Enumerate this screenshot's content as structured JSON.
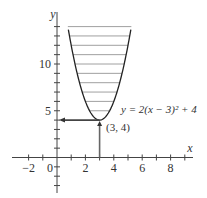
{
  "chart_data": {
    "type": "line",
    "title": "",
    "equation_label": "y = 2(x − 3)² + 4",
    "point_label": "(3, 4)",
    "xlabel": "x",
    "ylabel": "y",
    "xlim": [
      -3,
      9.5
    ],
    "ylim": [
      -2,
      15
    ],
    "x_ticks": [
      -2,
      0,
      2,
      4,
      6,
      8
    ],
    "x_tick_labels": [
      "−2",
      "0",
      "2",
      "4",
      "6",
      "8"
    ],
    "y_ticks": [
      5,
      10
    ],
    "y_tick_labels": [
      "5",
      "10"
    ],
    "series": [
      {
        "name": "y = 2(x − 3)² + 4",
        "function": "2*(x-3)^2+4",
        "x_range": [
          0.8,
          5.2
        ]
      }
    ],
    "vertex": {
      "x": 3,
      "y": 4
    },
    "shading": {
      "type": "horizontal lines",
      "y_from": 4,
      "y_to": 14,
      "step": 1
    },
    "annotations": [
      {
        "type": "arrow",
        "from": [
          3,
          0
        ],
        "to": [
          3,
          4
        ],
        "description": "vertical arrow up from x=3 to vertex"
      },
      {
        "type": "arrow",
        "from": [
          3,
          4
        ],
        "to": [
          0,
          4
        ],
        "description": "horizontal arrow left from vertex to y-axis"
      }
    ],
    "grid": false,
    "legend": "none"
  }
}
